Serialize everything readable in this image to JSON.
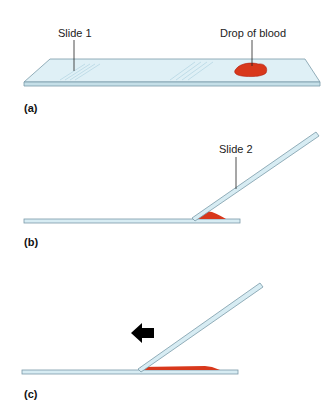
{
  "figure": {
    "panels": [
      {
        "id": "a",
        "label": "(a)",
        "annotations": [
          "Slide 1",
          "Drop of blood"
        ]
      },
      {
        "id": "b",
        "label": "(b)",
        "annotations": [
          "Slide 2"
        ]
      },
      {
        "id": "c",
        "label": "(c)",
        "annotations": []
      }
    ],
    "labels": {
      "slide1": "Slide 1",
      "drop": "Drop of blood",
      "slide2": "Slide 2",
      "panel_a": "(a)",
      "panel_b": "(b)",
      "panel_c": "(c)"
    },
    "colors": {
      "slide_fill": "#d7ecf3",
      "slide_edge": "#7a9aa8",
      "blood": "#d8381c",
      "arrow": "#000000"
    },
    "arrow_direction": "left"
  }
}
